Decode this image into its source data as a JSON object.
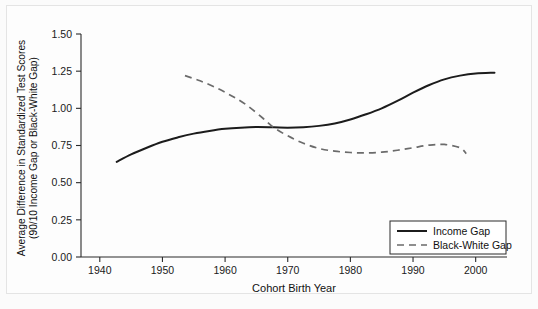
{
  "chart_data": {
    "type": "line",
    "title": "",
    "xlabel": "Cohort Birth Year",
    "ylabel": "Average Difference in Standardized Test Scores (90/10 Income Gap or Black-White Gap)",
    "ylabel_line1": "Average Difference in Standardized Test Scores",
    "ylabel_line2": "(90/10 Income Gap or Black-White Gap)",
    "xlim": [
      1937,
      2005
    ],
    "ylim": [
      0.0,
      1.5
    ],
    "xticks": [
      1940,
      1950,
      1960,
      1970,
      1980,
      1990,
      2000
    ],
    "xtick_labels": [
      "1940",
      "1950",
      "1960",
      "1970",
      "1980",
      "1990",
      "2000"
    ],
    "yticks": [
      0.0,
      0.25,
      0.5,
      0.75,
      1.0,
      1.25,
      1.5
    ],
    "ytick_labels": [
      "0.00",
      "0.25",
      "0.50",
      "0.75",
      "1.00",
      "1.25",
      "1.50"
    ],
    "grid": false,
    "legend_position": "lower-right",
    "series": [
      {
        "name": "Income Gap",
        "style": "solid",
        "color": "#1c1c1c",
        "x": [
          1942.7,
          1945,
          1947.5,
          1950,
          1952.5,
          1955,
          1957.5,
          1960,
          1962.5,
          1965,
          1967.8,
          1970,
          1972.5,
          1975,
          1977.5,
          1980,
          1982.5,
          1985,
          1987.5,
          1990,
          1992.5,
          1995,
          1997.5,
          2000,
          2003
        ],
        "y": [
          0.64,
          0.69,
          0.735,
          0.775,
          0.805,
          0.83,
          0.848,
          0.862,
          0.87,
          0.874,
          0.872,
          0.87,
          0.873,
          0.882,
          0.898,
          0.925,
          0.96,
          1.0,
          1.05,
          1.105,
          1.155,
          1.195,
          1.22,
          1.235,
          1.24
        ]
      },
      {
        "name": "Black-White Gap",
        "style": "dashed",
        "color": "#6b6b6b",
        "x": [
          1953.6,
          1956,
          1958.5,
          1961,
          1963.5,
          1966,
          1967.8,
          1970,
          1972.5,
          1975,
          1977.5,
          1980,
          1982.5,
          1985,
          1987.5,
          1990,
          1992.5,
          1995,
          1997.5,
          1998.5
        ],
        "y": [
          1.22,
          1.185,
          1.14,
          1.085,
          1.02,
          0.935,
          0.87,
          0.815,
          0.765,
          0.73,
          0.712,
          0.703,
          0.7,
          0.705,
          0.718,
          0.735,
          0.752,
          0.757,
          0.735,
          0.695
        ]
      }
    ],
    "annotations": []
  },
  "legend": {
    "entries": [
      {
        "label": "Income Gap",
        "style": "solid"
      },
      {
        "label": "Black-White Gap",
        "style": "dashed"
      }
    ]
  }
}
